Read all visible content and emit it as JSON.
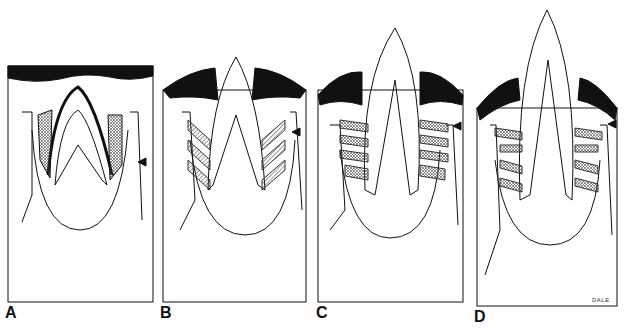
{
  "figure": {
    "panels": [
      {
        "label": "A"
      },
      {
        "label": "B"
      },
      {
        "label": "C"
      },
      {
        "label": "D"
      }
    ],
    "signature": "DALE",
    "colors": {
      "ink": "#111111",
      "background": "#ffffff",
      "hatch": "#555555"
    }
  }
}
